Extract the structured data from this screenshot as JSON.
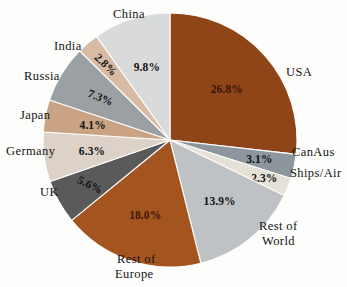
{
  "chart_data": {
    "type": "pie",
    "title": "",
    "subtitle": "",
    "xlabel": "",
    "ylabel": "",
    "legend_position": "none",
    "grid": false,
    "units": "percent",
    "total": 100.0,
    "start_angle_deg": 0,
    "direction": "clockwise",
    "categories": [
      "USA",
      "CanAus",
      "Ships/Air",
      "Rest of World",
      "Rest of Europe",
      "UK",
      "Germany",
      "Japan",
      "Russia",
      "India",
      "China"
    ],
    "values": [
      26.8,
      3.1,
      2.3,
      13.9,
      18.0,
      5.6,
      6.3,
      4.1,
      7.3,
      2.8,
      9.8
    ],
    "value_labels": [
      "26.8%",
      "3.1%",
      "2.3%",
      "13.9%",
      "18.0%",
      "5.6%",
      "6.3%",
      "4.1%",
      "7.3%",
      "2.8%",
      "9.8%"
    ],
    "colors": [
      "#8f4518",
      "#8c969c",
      "#e6e1d6",
      "#bec2c4",
      "#a4551f",
      "#5a5a5a",
      "#dcd2c8",
      "#c9a384",
      "#9aa0a3",
      "#d7bba4",
      "#d9dada"
    ],
    "slices": [
      {
        "label": "USA",
        "value": 26.8,
        "value_label": "26.8%",
        "color": "#8f4518",
        "label_color": "#3b1608"
      },
      {
        "label": "CanAus",
        "value": 3.1,
        "value_label": "3.1%",
        "color": "#8c969c",
        "label_color": "#131313"
      },
      {
        "label": "Ships/Air",
        "value": 2.3,
        "value_label": "2.3%",
        "color": "#e6e1d6",
        "label_color": "#131313"
      },
      {
        "label": "Rest of World",
        "value": 13.9,
        "value_label": "13.9%",
        "color": "#bec2c4",
        "label_color": "#131313"
      },
      {
        "label": "Rest of Europe",
        "value": 18.0,
        "value_label": "18.0%",
        "color": "#a4551f",
        "label_color": "#3b1608"
      },
      {
        "label": "UK",
        "value": 5.6,
        "value_label": "5.6%",
        "color": "#5a5a5a",
        "label_color": "#131313"
      },
      {
        "label": "Germany",
        "value": 6.3,
        "value_label": "6.3%",
        "color": "#dcd2c8",
        "label_color": "#131313"
      },
      {
        "label": "Japan",
        "value": 4.1,
        "value_label": "4.1%",
        "color": "#c9a384",
        "label_color": "#131313"
      },
      {
        "label": "Russia",
        "value": 7.3,
        "value_label": "7.3%",
        "color": "#9aa0a3",
        "label_color": "#131313"
      },
      {
        "label": "India",
        "value": 2.8,
        "value_label": "2.8%",
        "color": "#d7bba4",
        "label_color": "#131313"
      },
      {
        "label": "China",
        "value": 9.8,
        "value_label": "9.8%",
        "color": "#d9dada",
        "label_color": "#131313"
      }
    ]
  },
  "labels": {
    "usa": "USA",
    "canaus": "CanAus",
    "ships_air": "Ships/Air",
    "rest_of_world_line1": "Rest of",
    "rest_of_world_line2": "World",
    "rest_of_europe_line1": "Rest of",
    "rest_of_europe_line2": "Europe",
    "uk": "UK",
    "germany": "Germany",
    "japan": "Japan",
    "russia": "Russia",
    "india": "India",
    "china": "China"
  },
  "percent_labels": {
    "usa": "26.8%",
    "canaus": "3.1%",
    "ships_air": "2.3%",
    "rest_of_world": "13.9%",
    "rest_of_europe": "18.0%",
    "uk": "5.6%",
    "germany": "6.3%",
    "japan": "4.1%",
    "russia": "7.3%",
    "india": "2.8%",
    "china": "9.8%"
  },
  "geometry": {
    "center_x": 170,
    "center_y": 140,
    "radius": 127
  },
  "background_color": "#fdfdfb"
}
